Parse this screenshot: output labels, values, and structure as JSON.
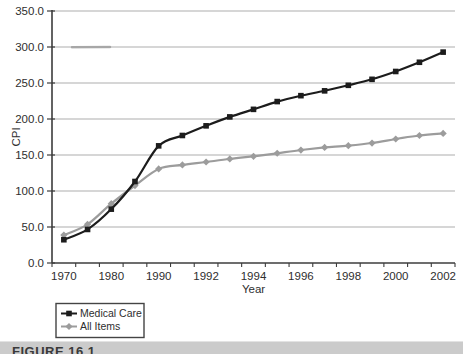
{
  "figure_caption": "FIGURE 16.1",
  "colors": {
    "grid": "#adadad",
    "axis": "#3c3c3c",
    "text": "#2e2e2e",
    "medical_care": "#1c1c1c",
    "all_items": "#9c9c9c",
    "legend_border": "#444444",
    "caption_bar": "#cbcbcb",
    "caption_text": "#3a3a3a"
  },
  "chart_data": {
    "type": "line",
    "title": "",
    "xlabel": "Year",
    "ylabel": "CPI",
    "ylim": [
      0,
      350
    ],
    "ytick_step": 50,
    "ytick_labels": [
      "0.0",
      "50.0",
      "100.0",
      "150.0",
      "200.0",
      "250.0",
      "300.0",
      "350.0"
    ],
    "grid": true,
    "smoothed_lines": true,
    "legend_position": "bottom-left",
    "categories": [
      "1970",
      "1975",
      "1980",
      "1985",
      "1990",
      "1991",
      "1992",
      "1993",
      "1994",
      "1995",
      "1996",
      "1997",
      "1998",
      "1999",
      "2000",
      "2001",
      "2002"
    ],
    "xtick_indices": [
      0,
      2,
      4,
      6,
      8,
      10,
      12,
      14,
      16
    ],
    "xtick_labels": [
      "1970",
      "1980",
      "1990",
      "1992",
      "1994",
      "1996",
      "1998",
      "2000",
      "2002"
    ],
    "series": [
      {
        "name": "Medical Care",
        "marker": "square",
        "color": "#1c1c1c",
        "values": [
          32.3,
          46.6,
          74.8,
          113.2,
          162.7,
          177.1,
          190.5,
          202.9,
          213.4,
          224.2,
          232.4,
          239.1,
          246.8,
          255.1,
          266.0,
          278.8,
          292.9
        ]
      },
      {
        "name": "All Items",
        "marker": "diamond",
        "color": "#9c9c9c",
        "values": [
          38.8,
          53.8,
          82.4,
          107.6,
          130.7,
          136.2,
          140.3,
          144.5,
          148.2,
          152.4,
          156.9,
          160.5,
          163.0,
          166.6,
          172.2,
          177.1,
          179.9
        ]
      }
    ]
  }
}
